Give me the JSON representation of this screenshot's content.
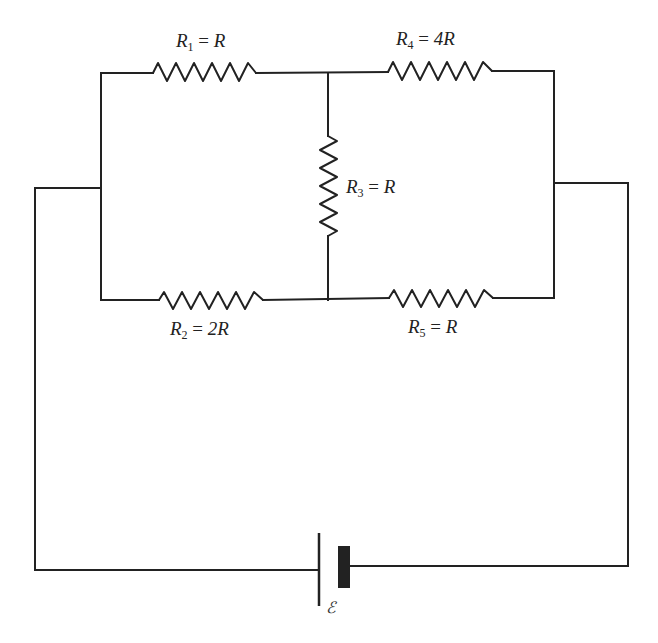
{
  "diagram": {
    "type": "circuit",
    "resistors": [
      {
        "id": "R1",
        "sym": "R",
        "sub": "1",
        "eq": "=",
        "value": "R"
      },
      {
        "id": "R2",
        "sym": "R",
        "sub": "2",
        "eq": "=",
        "value": "2R"
      },
      {
        "id": "R3",
        "sym": "R",
        "sub": "3",
        "eq": "=",
        "value": "R"
      },
      {
        "id": "R4",
        "sym": "R",
        "sub": "4",
        "eq": "=",
        "value": "4R"
      },
      {
        "id": "R5",
        "sym": "R",
        "sub": "5",
        "eq": "=",
        "value": "R"
      }
    ],
    "battery": {
      "label": "ℰ"
    },
    "colors": {
      "line": "#222222",
      "background": "#ffffff"
    }
  }
}
